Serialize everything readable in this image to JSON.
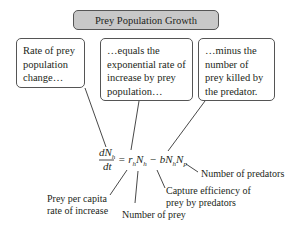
{
  "title": "Prey Population Growth",
  "boxes": {
    "rate_change": "Rate of prey population change…",
    "exponential": "…equals the exponential rate of increase by prey population…",
    "minus_killed": "…minus the number of prey killed by the predator."
  },
  "equation": {
    "numerator": "dN",
    "numerator_sub": "h",
    "denominator": "dt",
    "rhs": "= r_h N_h − b N_h N_p"
  },
  "labels": {
    "per_capita_1": "Prey per capita",
    "per_capita_2": "rate of increase",
    "number_prey": "Number of prey",
    "capture_1": "Capture efficiency of",
    "capture_2": "prey by predators",
    "number_predators": "Number of predators"
  }
}
